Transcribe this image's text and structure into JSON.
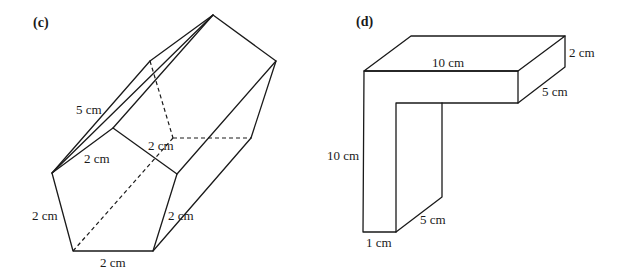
{
  "figures": [
    {
      "id": "c",
      "panel_label": "(c)",
      "shape": "pentagonal prism",
      "labels": {
        "slant_edge": "5 cm",
        "top_left_side": "2 cm",
        "top_right_side": "2 cm",
        "left_side": "2 cm",
        "right_side": "2 cm",
        "bottom_side": "2 cm"
      }
    },
    {
      "id": "d",
      "panel_label": "(d)",
      "shape": "L-shaped prism",
      "labels": {
        "top_length": "10 cm",
        "thickness": "2 cm",
        "depth_top": "5 cm",
        "height": "10 cm",
        "depth_bottom": "5 cm",
        "width_bottom": "1 cm"
      }
    }
  ]
}
